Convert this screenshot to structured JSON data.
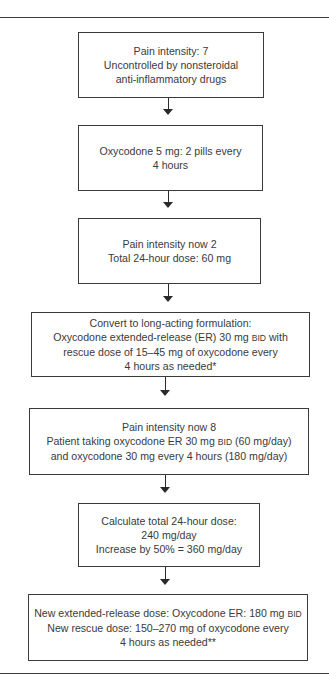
{
  "flowchart": {
    "steps": [
      {
        "lines": [
          "Pain intensity: 7",
          "Uncontrolled by nonsteroidal",
          "anti-inflammatory drugs"
        ]
      },
      {
        "lines": [
          "Oxycodone 5 mg: 2 pills every",
          "4 hours"
        ]
      },
      {
        "lines": [
          "Pain intensity now 2",
          "Total 24-hour dose: 60 mg"
        ]
      },
      {
        "lines": [
          "Convert to long-acting formulation:",
          "Oxycodone extended-release (ER) 30 mg",
          "BID",
          " with",
          "rescue dose of 15–45 mg of oxycodone every",
          "4 hours as needed*"
        ]
      },
      {
        "lines": [
          "Pain intensity now 8",
          "Patient taking oxycodone ER 30 mg ",
          "BID",
          " (60 mg/day)",
          "and oxycodone 30 mg every 4 hours (180 mg/day)"
        ]
      },
      {
        "lines": [
          "Calculate total 24-hour dose:",
          "240 mg/day",
          "Increase by 50% = 360 mg/day"
        ]
      },
      {
        "lines": [
          "New extended-release dose: Oxycodone ER: 180 mg ",
          "BID",
          "New rescue dose: 150–270 mg of oxycodone every",
          "4 hours as needed**"
        ]
      }
    ]
  },
  "colors": {
    "line": "#3a3a3a",
    "text": "#3a3a3a",
    "background": "#ffffff"
  }
}
